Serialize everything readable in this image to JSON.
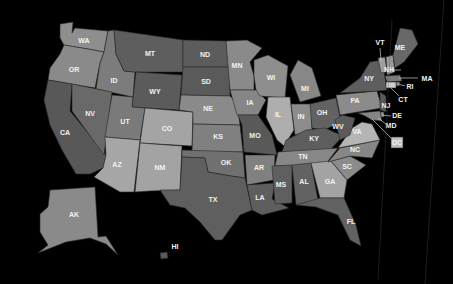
{
  "map": {
    "background": "#000000",
    "states": [
      {
        "id": "WA",
        "color": "#8e8e8e",
        "label_xy": [
          84,
          41
        ],
        "points": "60,24 73,22 72,33 75,28 108,31 104,52 88,49 64,45 60,38"
      },
      {
        "id": "OR",
        "color": "#8a8a8a",
        "label_xy": [
          74,
          70
        ],
        "points": "64,45 88,49 104,52 100,63 95,88 48,80 50,68 60,54"
      },
      {
        "id": "CA",
        "color": "#585858",
        "label_xy": [
          65,
          133
        ],
        "points": "48,80 72,84 70,111 106,155 103,168 90,174 76,174 62,150 50,125 44,100"
      },
      {
        "id": "ID",
        "color": "#7c7c7c",
        "label_xy": [
          114,
          81
        ],
        "points": "108,31 114,30 116,54 124,71 135,72 133,97 96,89 100,63 104,52"
      },
      {
        "id": "NV",
        "color": "#696969",
        "label_xy": [
          90,
          114
        ],
        "points": "72,84 112,92 104,155 72,111"
      },
      {
        "id": "MT",
        "color": "#5e5e5e",
        "label_xy": [
          150,
          54
        ],
        "points": "114,30 183,40 183,72 135,72 124,71 116,54"
      },
      {
        "id": "WY",
        "color": "#5b5b5b",
        "label_xy": [
          155,
          92
        ],
        "points": "136,72 182,75 179,110 132,107"
      },
      {
        "id": "UT",
        "color": "#7a7a7a",
        "label_xy": [
          125,
          122
        ],
        "points": "112,95 133,97 132,107 145,108 140,140 105,137"
      },
      {
        "id": "CO",
        "color": "#a4a4a4",
        "label_xy": [
          167,
          129
        ],
        "points": "145,108 193,112 192,146 140,143"
      },
      {
        "id": "AZ",
        "color": "#a6a6a6",
        "label_xy": [
          117,
          165
        ],
        "points": "105,137 140,140 134,192 120,192 94,177 103,168 106,155"
      },
      {
        "id": "NM",
        "color": "#a3a3a3",
        "label_xy": [
          160,
          168
        ],
        "points": "140,143 182,146 180,190 150,191 135,192"
      },
      {
        "id": "ND",
        "color": "#5c5c5c",
        "label_xy": [
          205,
          55
        ],
        "points": "183,40 226,41 229,67 183,67"
      },
      {
        "id": "SD",
        "color": "#5a5a5a",
        "label_xy": [
          206,
          82
        ],
        "points": "183,67 229,67 230,96 181,95"
      },
      {
        "id": "NE",
        "color": "#8a8a8a",
        "label_xy": [
          208,
          109
        ],
        "points": "181,95 230,96 237,103 240,125 193,124 193,112 179,110"
      },
      {
        "id": "KS",
        "color": "#808080",
        "label_xy": [
          218,
          137
        ],
        "points": "193,124 240,125 243,152 192,152"
      },
      {
        "id": "OK",
        "color": "#707070",
        "label_xy": [
          226,
          163
        ],
        "points": "182,150 243,152 245,178 231,176 208,172 205,158 182,157"
      },
      {
        "id": "TX",
        "color": "#5f5f5f",
        "label_xy": [
          213,
          200
        ],
        "points": "182,157 205,158 208,172 231,176 245,178 252,210 240,215 222,240 215,240 200,222 185,208 170,205 160,190 180,190"
      },
      {
        "id": "MN",
        "color": "#8a8a8a",
        "label_xy": [
          237,
          66
        ],
        "points": "226,41 247,40 262,48 250,62 254,76 254,90 230,90"
      },
      {
        "id": "IA",
        "color": "#868686",
        "label_xy": [
          250,
          103
        ],
        "points": "230,90 256,90 266,100 258,115 237,115"
      },
      {
        "id": "MO",
        "color": "#595959",
        "label_xy": [
          255,
          136
        ],
        "points": "238,115 258,115 272,135 277,155 244,152 242,125"
      },
      {
        "id": "AR",
        "color": "#808080",
        "label_xy": [
          259,
          168
        ],
        "points": "245,155 275,155 274,180 247,185"
      },
      {
        "id": "LA",
        "color": "#5e5e5e",
        "label_xy": [
          260,
          198
        ],
        "points": "247,185 275,183 272,199 289,208 262,215 252,210"
      },
      {
        "id": "WI",
        "color": "#8e8e8e",
        "label_xy": [
          271,
          78
        ],
        "points": "254,60 268,55 288,66 285,98 260,96 256,90 254,76"
      },
      {
        "id": "IL",
        "color": "#aeaeae",
        "label_xy": [
          278,
          115
        ],
        "points": "268,97 290,97 294,130 284,146 277,140 266,117"
      },
      {
        "id": "MI",
        "color": "#878787",
        "label_xy": [
          305,
          89
        ],
        "points": "290,75 298,60 312,68 321,96 300,102"
      },
      {
        "id": "IN",
        "color": "#8c8c8c",
        "label_xy": [
          301,
          117
        ],
        "points": "291,104 311,104 312,130 295,135"
      },
      {
        "id": "OH",
        "color": "#626262",
        "label_xy": [
          322,
          113
        ],
        "points": "310,104 336,98 341,122 324,130 312,128"
      },
      {
        "id": "KY",
        "color": "#5e5e5e",
        "label_xy": [
          314,
          139
        ],
        "points": "286,140 306,130 325,128 343,136 330,150 282,152"
      },
      {
        "id": "TN",
        "color": "#878787",
        "label_xy": [
          303,
          157
        ],
        "points": "278,152 338,148 325,165 275,166"
      },
      {
        "id": "MS",
        "color": "#5f5f5f",
        "label_xy": [
          281,
          185
        ],
        "points": "272,166 292,165 292,203 275,204"
      },
      {
        "id": "AL",
        "color": "#626262",
        "label_xy": [
          304,
          182
        ],
        "points": "292,165 311,163 318,200 296,205"
      },
      {
        "id": "GA",
        "color": "#a3a3a3",
        "label_xy": [
          330,
          182
        ],
        "points": "311,163 331,161 347,180 344,198 320,198"
      },
      {
        "id": "FL",
        "color": "#626262",
        "label_xy": [
          351,
          222
        ],
        "points": "296,205 320,198 344,198 356,225 361,246 350,240 338,215 316,207"
      },
      {
        "id": "SC",
        "color": "#8b8b8b",
        "label_xy": [
          347,
          167
        ],
        "points": "331,161 350,156 366,165 347,180"
      },
      {
        "id": "NC",
        "color": "#878787",
        "label_xy": [
          355,
          150
        ],
        "points": "328,162 340,148 380,140 372,158 350,156"
      },
      {
        "id": "VA",
        "color": "#b5b5b5",
        "label_xy": [
          357,
          132
        ],
        "points": "338,148 352,128 362,122 372,124 380,140"
      },
      {
        "id": "WV",
        "color": "#5b5b5b",
        "label_xy": [
          338,
          127
        ],
        "points": "335,120 342,115 355,118 350,135 340,140"
      },
      {
        "id": "PA",
        "color": "#8b8b8b",
        "label_xy": [
          355,
          101
        ],
        "points": "336,95 377,91 382,108 340,115"
      },
      {
        "id": "NY",
        "color": "#5e5e5e",
        "label_xy": [
          369,
          79
        ],
        "points": "340,93 360,78 370,62 382,60 387,90 378,91"
      },
      {
        "id": "VT",
        "color": "#9e9e9e",
        "label_xy": [
          380,
          43
        ],
        "points": "378,58 385,57 387,72 381,73"
      },
      {
        "id": "NH",
        "color": "#9a9a9a",
        "label_xy": [
          389,
          70
        ],
        "points": "386,57 393,55 395,72 387,75"
      },
      {
        "id": "ME",
        "color": "#686868",
        "label_xy": [
          400,
          48
        ],
        "points": "393,55 400,28 412,30 418,44 404,62 395,68"
      },
      {
        "id": "MA",
        "color": "#7a7a7a",
        "label_xy": [
          427,
          79
        ],
        "points": "385,76 400,75 402,81 387,82"
      },
      {
        "id": "RI",
        "color": "#8e8e8e",
        "label_xy": [
          410,
          87
        ],
        "points": "396,82 400,82 399,86 396,86"
      },
      {
        "id": "CT",
        "color": "#cfcfcf",
        "label_xy": [
          403,
          100
        ],
        "points": "386,82 396,82 396,88 386,88"
      },
      {
        "id": "NJ",
        "color": "#5a5a5a",
        "label_xy": [
          386,
          106
        ],
        "points": "380,92 386,96 386,112 380,110"
      },
      {
        "id": "DE",
        "color": "#8f8f8f",
        "label_xy": [
          397,
          116
        ],
        "points": "380,112 384,112 384,117 381,117"
      },
      {
        "id": "MD",
        "color": "#858585",
        "label_xy": [
          391,
          126
        ],
        "points": "358,113 380,111 382,121 372,120 365,116"
      },
      {
        "id": "AK",
        "color": "#8a8a8a",
        "label_xy": [
          74,
          215
        ],
        "points": "50,190 95,187 98,237 106,236 118,255 106,244 90,238 66,242 38,253 48,245 40,232 40,214 48,207"
      },
      {
        "id": "HI",
        "color": "#5a5a5a",
        "label_xy": [
          175,
          247
        ],
        "points": "160,253 167,252 168,258 161,259"
      },
      {
        "id": "DC",
        "color": "#bfbfbf",
        "label_xy": [
          397,
          143
        ],
        "points": "391,137 403,137 403,148 391,148"
      }
    ],
    "leaders": [
      {
        "id": "VT",
        "x1": 380,
        "y1": 48,
        "x2": 381,
        "y2": 61
      },
      {
        "id": "NH",
        "x1": 392,
        "y1": 70,
        "x2": 401,
        "y2": 70
      },
      {
        "id": "MA",
        "x1": 399,
        "y1": 78,
        "x2": 418,
        "y2": 78
      },
      {
        "id": "RI",
        "x1": 398,
        "y1": 84,
        "x2": 405,
        "y2": 86
      },
      {
        "id": "CT",
        "x1": 391,
        "y1": 88,
        "x2": 399,
        "y2": 96
      },
      {
        "id": "DE",
        "x1": 382,
        "y1": 115,
        "x2": 391,
        "y2": 116
      },
      {
        "id": "MD",
        "x1": 378,
        "y1": 118,
        "x2": 386,
        "y2": 124
      },
      {
        "id": "DC",
        "x1": 372,
        "y1": 119,
        "x2": 391,
        "y2": 138
      }
    ]
  }
}
